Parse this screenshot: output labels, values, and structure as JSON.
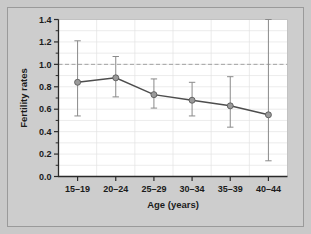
{
  "figure": {
    "background_color": "#cdcdcd",
    "plot_background_color": "#ffffff",
    "frame_color": "#9a9a9a"
  },
  "chart_data": {
    "type": "line",
    "title": "",
    "subtitle": "",
    "xlabel": "Age (years)",
    "ylabel": "Fertility rates",
    "categories": [
      "15–19",
      "20–24",
      "25–29",
      "30–34",
      "35–39",
      "40–44"
    ],
    "values": [
      0.84,
      0.88,
      0.73,
      0.68,
      0.63,
      0.55
    ],
    "error_low": [
      0.54,
      0.71,
      0.61,
      0.54,
      0.44,
      0.14
    ],
    "error_high": [
      1.21,
      1.07,
      0.87,
      0.84,
      0.89,
      1.4
    ],
    "ylim": [
      0.0,
      1.4
    ],
    "y_ticks": [
      0.0,
      0.2,
      0.4,
      0.6,
      0.8,
      1.0,
      1.2,
      1.4
    ],
    "y_tick_labels": [
      "0.0",
      "0.2",
      "0.4",
      "0.6",
      "0.8",
      "1.0",
      "1.2",
      "1.4"
    ],
    "y_minor_ticks": [
      0.1,
      0.3,
      0.5,
      0.7,
      0.9,
      1.1,
      1.3
    ],
    "grid": true,
    "grid_color": "#e2e2e2",
    "legend": null,
    "reference_line": {
      "value": 1.0,
      "style": "dashed",
      "color": "#9b9b9b",
      "label": ""
    },
    "series_color": "#8a8a8a",
    "line_color": "#4d4d4d",
    "marker": "circle",
    "marker_color": "#9a9a9a",
    "marker_edge_color": "#5a5a5a"
  }
}
